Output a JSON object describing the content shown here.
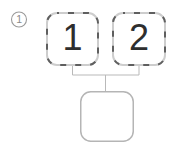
{
  "figure": {
    "step_marker": {
      "label": "1"
    },
    "sources": [
      {
        "label": "1"
      },
      {
        "label": "2"
      }
    ],
    "result_box": {
      "label": ""
    },
    "colors": {
      "dash-dark": "#5f5f5f",
      "border-light": "#cdcdcd",
      "connector": "#b9b9b9",
      "result-border": "#b5b5b5",
      "digit": "#2e2e2e",
      "marker-stroke": "#9a9a9a",
      "marker-text": "#8a8a8a",
      "background": "#ffffff"
    }
  }
}
